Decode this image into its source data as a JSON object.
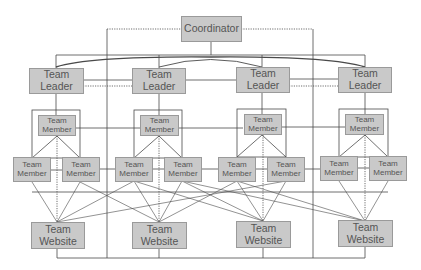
{
  "diagram": {
    "coordinator": {
      "label": "Coordinator"
    },
    "teams": [
      {
        "leader": {
          "line1": "Team",
          "line2": "Leader"
        },
        "top_member": {
          "line1": "Team",
          "line2": "Member"
        },
        "bottom_members": [
          {
            "line1": "Team",
            "line2": "Member"
          },
          {
            "line1": "Team",
            "line2": "Member"
          }
        ],
        "website": {
          "line1": "Team",
          "line2": "Website"
        }
      },
      {
        "leader": {
          "line1": "Team",
          "line2": "Leader"
        },
        "top_member": {
          "line1": "Team",
          "line2": "Member"
        },
        "bottom_members": [
          {
            "line1": "Team",
            "line2": "Member"
          },
          {
            "line1": "Team",
            "line2": "Member"
          }
        ],
        "website": {
          "line1": "Team",
          "line2": "Website"
        }
      },
      {
        "leader": {
          "line1": "Team",
          "line2": "Leader"
        },
        "top_member": {
          "line1": "Team",
          "line2": "Member"
        },
        "bottom_members": [
          {
            "line1": "Team",
            "line2": "Member"
          },
          {
            "line1": "Team",
            "line2": "Member"
          }
        ],
        "website": {
          "line1": "Team",
          "line2": "Website"
        }
      },
      {
        "leader": {
          "line1": "Team",
          "line2": "Leader"
        },
        "top_member": {
          "line1": "Team",
          "line2": "Member"
        },
        "bottom_members": [
          {
            "line1": "Team",
            "line2": "Member"
          },
          {
            "line1": "Team",
            "line2": "Member"
          }
        ],
        "website": {
          "line1": "Team",
          "line2": "Website"
        }
      }
    ],
    "colors": {
      "box_fill": "#c9c9c9",
      "box_border": "#9a9a9a",
      "text": "#555555",
      "line": "#4a4a4a"
    }
  }
}
